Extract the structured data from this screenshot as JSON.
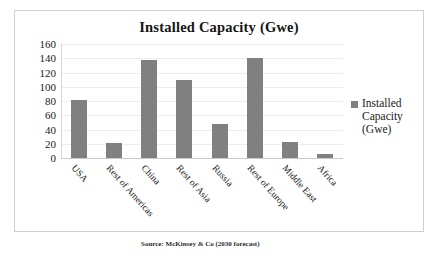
{
  "chart_data": {
    "type": "bar",
    "title": "Installed Capacity (Gwe)",
    "xlabel": "",
    "ylabel": "",
    "ylim": [
      0,
      160
    ],
    "ytick_step": 20,
    "yticks": [
      "160",
      "140",
      "120",
      "100",
      "80",
      "60",
      "40",
      "20",
      "0"
    ],
    "grid": true,
    "legend_position": "right",
    "categories": [
      "USA",
      "Rest of Americas",
      "China",
      "Rest of Asia",
      "Russia",
      "Rest of Europe",
      "Middle East",
      "Africa"
    ],
    "series": [
      {
        "name": "Installed Capacity (Gwe)",
        "color": "#808080",
        "values": [
          81,
          21,
          138,
          110,
          48,
          140,
          23,
          5
        ]
      }
    ]
  },
  "legend": {
    "entries": [
      {
        "label_line1": "Installed",
        "label_line2": "Capacity",
        "label_line3": "(Gwe)"
      }
    ]
  },
  "caption": {
    "text": "Source:  McKinsey & Co (2030 forecast)"
  },
  "colors": {
    "bar": "#808080",
    "gridline": "#ededed",
    "axis": "#c8c8c8",
    "frame_border": "#cfcfcf",
    "text": "#1a1a1a"
  }
}
